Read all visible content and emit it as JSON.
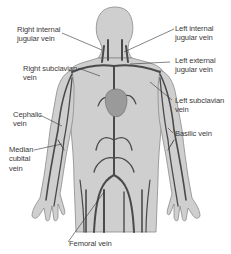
{
  "diagram": {
    "colors": {
      "body_fill": "#cfcfcf",
      "body_outline": "#8a8a8a",
      "vein": "#4a4a4a",
      "heart": "#9a9a9a",
      "leader_line": "#333333",
      "label_text": "#3a3a3a"
    },
    "labels": [
      {
        "id": "right-internal-jugular-vein",
        "text": "Right internal\njugular vein",
        "side": "left"
      },
      {
        "id": "right-subclavian-vein",
        "text": "Right subclavian\nvein",
        "side": "left"
      },
      {
        "id": "cephalic-vein",
        "text": "Cephalic\nvein",
        "side": "left"
      },
      {
        "id": "median-cubital-vein",
        "text": "Median\ncubital\nvein",
        "side": "left"
      },
      {
        "id": "femoral-vein",
        "text": "Femoral vein",
        "side": "bottom"
      },
      {
        "id": "left-internal-jugular-vein",
        "text": "Left internal\njugular vein",
        "side": "right"
      },
      {
        "id": "left-external-jugular-vein",
        "text": "Left external\njugular vein",
        "side": "right"
      },
      {
        "id": "left-subclavian-vein",
        "text": "Left subclavian\nvein",
        "side": "right"
      },
      {
        "id": "basilic-vein",
        "text": "Basilic vein",
        "side": "right"
      }
    ]
  }
}
